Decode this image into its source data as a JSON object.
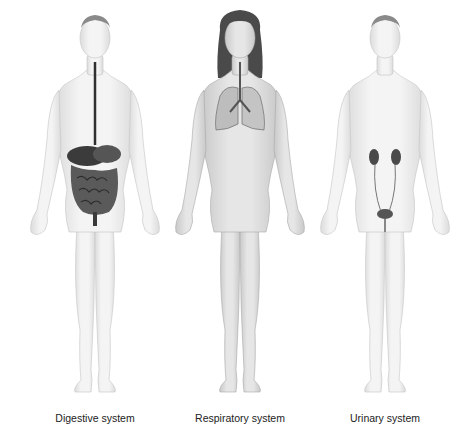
{
  "figures": [
    {
      "label": "Digestive system",
      "organ": "digestive-tract"
    },
    {
      "label": "Respiratory system",
      "organ": "lungs"
    },
    {
      "label": "Urinary system",
      "organ": "kidneys-bladder"
    }
  ],
  "colors": {
    "skin": "#f1f1f1",
    "skin_shade": "#d6d6d6",
    "outline": "#b5b5b5",
    "hair_male": "#7a7a7a",
    "hair_female": "#4a4a4a",
    "organ_dark": "#3a3a3a",
    "organ_mid": "#6a6a6a",
    "lung": "#bdbdbd",
    "label": "#222222"
  }
}
